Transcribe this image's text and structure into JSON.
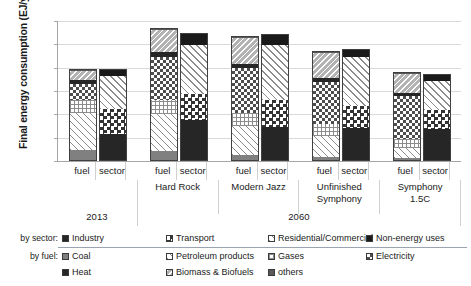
{
  "chart_data": {
    "type": "bar",
    "title": "",
    "xlabel": "",
    "ylabel": "Final energy consumption (EJ/yr.)",
    "ylim": [
      0,
      600
    ],
    "yticks": [
      0,
      100,
      200,
      300,
      400,
      500,
      600
    ],
    "grid": true,
    "stacked": true,
    "legend_position": "bottom",
    "categories": [
      "fuel",
      "sector"
    ],
    "groups": [
      {
        "name": "2013",
        "scenario": "",
        "year": "2013"
      },
      {
        "name": "Hard Rock",
        "scenario": "Hard Rock",
        "year": "2060"
      },
      {
        "name": "Modern Jazz",
        "scenario": "Modern Jazz",
        "year": "2060"
      },
      {
        "name": "Unfinished Symphony",
        "scenario": "Unfinished Symphony",
        "year": "2060"
      },
      {
        "name": "Symphony 1.5C",
        "scenario": "Symphony 1.5C",
        "year": "2060"
      }
    ],
    "fuel_series": [
      {
        "name": "Coal",
        "key": "coal",
        "values": [
          44,
          40,
          20,
          14,
          10
        ]
      },
      {
        "name": "Petroleum products",
        "key": "petroleum",
        "values": [
          163,
          160,
          128,
          92,
          44
        ]
      },
      {
        "name": "Gases",
        "key": "gases",
        "values": [
          58,
          60,
          56,
          50,
          38
        ]
      },
      {
        "name": "Electricity",
        "key": "electricity",
        "values": [
          69,
          188,
          196,
          186,
          188
        ]
      },
      {
        "name": "Heat",
        "key": "heat",
        "values": [
          16,
          20,
          18,
          14,
          14
        ]
      },
      {
        "name": "Biomass & Biofuels",
        "key": "biomass",
        "values": [
          42,
          98,
          112,
          112,
          82
        ]
      },
      {
        "name": "others",
        "key": "others",
        "values": [
          1,
          4,
          4,
          4,
          4
        ]
      }
    ],
    "sector_series": [
      {
        "name": "Industry",
        "key": "industry",
        "values": [
          115,
          175,
          145,
          140,
          134
        ]
      },
      {
        "name": "Transport",
        "key": "transport",
        "values": [
          110,
          112,
          116,
          96,
          84
        ]
      },
      {
        "name": "Residential/Commercial",
        "key": "rescom",
        "values": [
          145,
          215,
          240,
          212,
          128
        ]
      },
      {
        "name": "Non-energy uses",
        "key": "nonenergy",
        "values": [
          25,
          45,
          42,
          32,
          28
        ]
      }
    ],
    "totals_fuel": [
      393,
      570,
      534,
      472,
      380
    ],
    "totals_sector": [
      395,
      547,
      543,
      480,
      374
    ]
  },
  "axis": {
    "y_title": "Final energy consumption (EJ/yr.)",
    "y_ticks": [
      "600",
      "500",
      "400",
      "300",
      "200",
      "100",
      "0"
    ]
  },
  "xaxis": {
    "cat_labels": [
      "fuel",
      "sector",
      "fuel",
      "sector",
      "fuel",
      "sector",
      "fuel",
      "sector",
      "fuel",
      "sector"
    ],
    "group_labels": [
      "",
      "Hard Rock",
      "Modern Jazz",
      "Unfinished\nSymphony",
      "Symphony\n1.5C"
    ],
    "group_label_0": "",
    "group_label_1": "Hard Rock",
    "group_label_2": "Modern Jazz",
    "group_label_3a": "Unfinished",
    "group_label_3b": "Symphony",
    "group_label_4a": "Symphony",
    "group_label_4b": "1.5C",
    "year_labels": [
      "2013",
      "2060"
    ],
    "year_label_0": "2013",
    "year_label_1": "2060"
  },
  "legend": {
    "row1_tag": "by sector:",
    "row2_tag": "by fuel:",
    "sector_items": [
      {
        "label": "Industry",
        "swatch": "industry"
      },
      {
        "label": "Transport",
        "swatch": "transport"
      },
      {
        "label": "Residential/Commercial",
        "swatch": "rescom"
      },
      {
        "label": "Non-energy uses",
        "swatch": "nonenergy"
      }
    ],
    "fuel_items_row1": [
      {
        "label": "Coal",
        "swatch": "coal"
      },
      {
        "label": "Petroleum products",
        "swatch": "petroleum"
      },
      {
        "label": "Gases",
        "swatch": "gases"
      },
      {
        "label": "Electricity",
        "swatch": "electricity"
      }
    ],
    "fuel_items_row2": [
      {
        "label": "Heat",
        "swatch": "heat"
      },
      {
        "label": "Biomass & Biofuels",
        "swatch": "biomass"
      },
      {
        "label": "others",
        "swatch": "others"
      }
    ]
  },
  "colors": {
    "axis": "#a6a6a6",
    "grid": "#d9d9d9",
    "bar_outline": "#404040",
    "text": "#1a1a1a",
    "legend_rule": "#9aa5b1"
  }
}
